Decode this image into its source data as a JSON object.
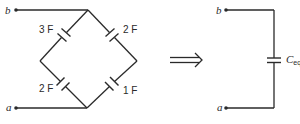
{
  "left_circuit": {
    "terminal_top": "b",
    "terminal_bottom": "a",
    "capacitors": [
      {
        "position": "upper-left",
        "label": "3 F"
      },
      {
        "position": "upper-right",
        "label": "2 F"
      },
      {
        "position": "lower-left",
        "label": "2 F"
      },
      {
        "position": "lower-right",
        "label": "1 F"
      }
    ]
  },
  "arrow": "implies-arrow",
  "right_circuit": {
    "terminal_top": "b",
    "terminal_bottom": "a",
    "capacitor_label_main": "C",
    "capacitor_label_sub": "eq"
  }
}
